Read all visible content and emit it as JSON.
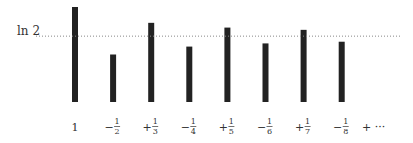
{
  "chart_data": {
    "type": "bar",
    "title": "",
    "xlabel": "",
    "ylabel": "",
    "categories": [
      {
        "sign": "",
        "num": "1",
        "den": ""
      },
      {
        "sign": "−",
        "num": "1",
        "den": "2"
      },
      {
        "sign": "+",
        "num": "1",
        "den": "3"
      },
      {
        "sign": "−",
        "num": "1",
        "den": "4"
      },
      {
        "sign": "+",
        "num": "1",
        "den": "5"
      },
      {
        "sign": "−",
        "num": "1",
        "den": "6"
      },
      {
        "sign": "+",
        "num": "1",
        "den": "7"
      },
      {
        "sign": "−",
        "num": "1",
        "den": "8"
      }
    ],
    "trailing_label": "+ ···",
    "values": [
      1.0,
      0.5,
      0.8333,
      0.5833,
      0.7833,
      0.6167,
      0.7595,
      0.6345
    ],
    "reference_line": {
      "label": "ln 2",
      "value": 0.6931,
      "style": "dotted"
    },
    "ylim": [
      0,
      1
    ],
    "grid": false,
    "bar_color": "#222222"
  }
}
